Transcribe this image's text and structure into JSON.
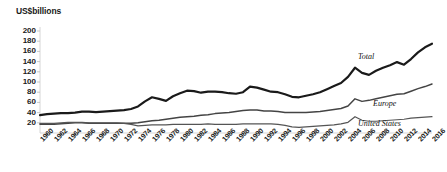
{
  "chart_data": {
    "type": "line",
    "title": "US$billions",
    "xlabel": "",
    "ylabel": "US$billions",
    "ylim": [
      0,
      200
    ],
    "xlim": [
      1960,
      2016
    ],
    "grid": false,
    "legend_position": "inline-right",
    "ytick_labels": [
      "200",
      "180",
      "160",
      "140",
      "120",
      "100",
      "80",
      "60",
      "40",
      "20"
    ],
    "ytick_values": [
      200,
      180,
      160,
      140,
      120,
      100,
      80,
      60,
      40,
      20
    ],
    "xtick_labels": [
      "1960",
      "1962",
      "1964",
      "1966",
      "1968",
      "1970",
      "1972",
      "1974",
      "1976",
      "1978",
      "1980",
      "1982",
      "1984",
      "1986",
      "1988",
      "1990",
      "1992",
      "1994",
      "1996",
      "1998",
      "2000",
      "2002",
      "2004",
      "2006",
      "2008",
      "2010",
      "2012",
      "2014",
      "2016"
    ],
    "x": [
      1960,
      1961,
      1962,
      1963,
      1964,
      1965,
      1966,
      1967,
      1968,
      1969,
      1970,
      1971,
      1972,
      1973,
      1974,
      1975,
      1976,
      1977,
      1978,
      1979,
      1980,
      1981,
      1982,
      1983,
      1984,
      1985,
      1986,
      1987,
      1988,
      1989,
      1990,
      1991,
      1992,
      1993,
      1994,
      1995,
      1996,
      1997,
      1998,
      1999,
      2000,
      2001,
      2002,
      2003,
      2004,
      2005,
      2006,
      2007,
      2008,
      2009,
      2010,
      2011,
      2012,
      2013,
      2014,
      2015,
      2016
    ],
    "series": [
      {
        "name": "Total",
        "color": "#1a1a1a",
        "width": 2.2,
        "values": [
          35,
          37,
          38,
          39,
          39,
          40,
          42,
          42,
          41,
          42,
          43,
          44,
          45,
          47,
          52,
          62,
          70,
          67,
          63,
          72,
          78,
          83,
          82,
          79,
          81,
          81,
          80,
          78,
          77,
          80,
          91,
          89,
          85,
          81,
          80,
          76,
          71,
          70,
          73,
          76,
          80,
          86,
          92,
          98,
          110,
          128,
          118,
          114,
          122,
          128,
          133,
          139,
          134,
          145,
          158,
          168,
          175
        ]
      },
      {
        "name": "Europe",
        "color": "#444444",
        "width": 1.5,
        "values": [
          17,
          17,
          17,
          18,
          19,
          20,
          20,
          19,
          19,
          19,
          19,
          19,
          19,
          19,
          20,
          22,
          24,
          25,
          27,
          29,
          31,
          32,
          33,
          35,
          36,
          38,
          39,
          40,
          42,
          44,
          45,
          45,
          43,
          43,
          42,
          40,
          40,
          40,
          40,
          41,
          42,
          44,
          46,
          48,
          53,
          67,
          62,
          64,
          67,
          70,
          73,
          76,
          77,
          82,
          87,
          91,
          96
        ]
      },
      {
        "name": "United States",
        "color": "#555555",
        "width": 1.2,
        "values": [
          19,
          19,
          19,
          20,
          21,
          21,
          21,
          20,
          20,
          20,
          20,
          20,
          19,
          17,
          14,
          15,
          16,
          16,
          16,
          17,
          17,
          17,
          17,
          17,
          18,
          17,
          17,
          17,
          17,
          18,
          18,
          18,
          18,
          18,
          17,
          15,
          12,
          11,
          12,
          13,
          14,
          15,
          16,
          18,
          21,
          32,
          25,
          23,
          23,
          24,
          25,
          26,
          27,
          29,
          30,
          31,
          32
        ]
      }
    ]
  },
  "series_labels": [
    {
      "name": "Total",
      "text": "Total"
    },
    {
      "name": "Europe",
      "text": "Europe"
    },
    {
      "name": "United States",
      "text": "United States"
    }
  ]
}
